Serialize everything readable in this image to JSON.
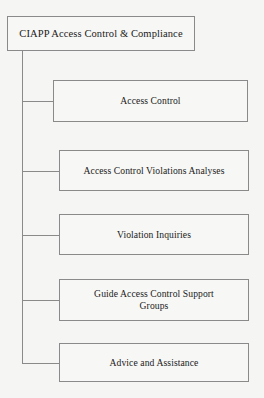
{
  "diagram": {
    "type": "organizational-hierarchy-tree",
    "orientation": "vertical-trunk-left",
    "colors": {
      "background": "#f5f5f3",
      "box_fill": "#f7f7f5",
      "border": "#8a8a8a",
      "text": "#1a1a1a"
    },
    "root": {
      "label": "CIAPP Access Control & Compliance"
    },
    "children": [
      {
        "label": "Access Control"
      },
      {
        "label": "Access Control Violations Analyses"
      },
      {
        "label": "Violation Inquiries"
      },
      {
        "label": "Guide Access Control Support\nGroups"
      },
      {
        "label": "Advice and Assistance"
      }
    ]
  }
}
